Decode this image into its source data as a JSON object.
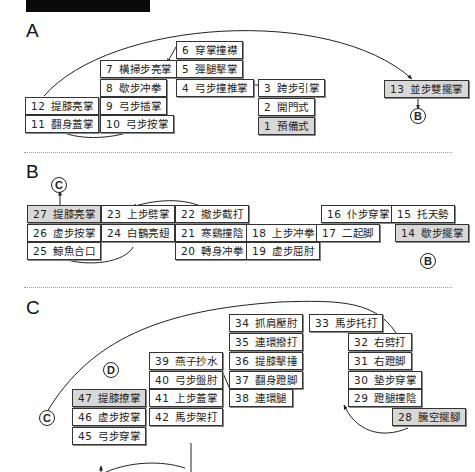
{
  "sections": {
    "A": {
      "label": "A",
      "steps": {
        "s1": {
          "num": "1",
          "name": "預備式"
        },
        "s2": {
          "num": "2",
          "name": "開門式"
        },
        "s3": {
          "num": "3",
          "name": "跨步引掌"
        },
        "s4": {
          "num": "4",
          "name": "弓步撞推掌"
        },
        "s5": {
          "num": "5",
          "name": "彈腿擊掌"
        },
        "s6": {
          "num": "6",
          "name": "穿掌撞襟"
        },
        "s7": {
          "num": "7",
          "name": "橫掃步亮掌"
        },
        "s8": {
          "num": "8",
          "name": "歇步冲拳"
        },
        "s9": {
          "num": "9",
          "name": "弓步插掌"
        },
        "s10": {
          "num": "10",
          "name": "弓步按掌"
        },
        "s11": {
          "num": "11",
          "name": "翻身蓋掌"
        },
        "s12": {
          "num": "12",
          "name": "提膝亮掌"
        },
        "s13": {
          "num": "13",
          "name": "並步雙擺掌"
        }
      },
      "connector_out": "B"
    },
    "B": {
      "label": "B",
      "connector_in": "B",
      "steps": {
        "s14": {
          "num": "14",
          "name": "歇步擺掌"
        },
        "s15": {
          "num": "15",
          "name": "托天勢"
        },
        "s16": {
          "num": "16",
          "name": "仆步穿掌"
        },
        "s17": {
          "num": "17",
          "name": "二起脚"
        },
        "s18": {
          "num": "18",
          "name": "上步冲拳"
        },
        "s19": {
          "num": "19",
          "name": "虚步屈肘"
        },
        "s20": {
          "num": "20",
          "name": "轉身冲拳"
        },
        "s21": {
          "num": "21",
          "name": "寒鷄撞陰"
        },
        "s22": {
          "num": "22",
          "name": "撤步截打"
        },
        "s23": {
          "num": "23",
          "name": "上步劈掌"
        },
        "s24": {
          "num": "24",
          "name": "白鶴亮翅"
        },
        "s25": {
          "num": "25",
          "name": "鯨魚合口"
        },
        "s26": {
          "num": "26",
          "name": "虚步按掌"
        },
        "s27": {
          "num": "27",
          "name": "提膝亮掌"
        }
      },
      "connector_out": "C"
    },
    "C": {
      "label": "C",
      "connector_in": "C",
      "steps": {
        "s28": {
          "num": "28",
          "name": "騰空擺腳"
        },
        "s29": {
          "num": "29",
          "name": "蹬腿撞陰"
        },
        "s30": {
          "num": "30",
          "name": "墊步穿掌"
        },
        "s31": {
          "num": "31",
          "name": "右蹬脚"
        },
        "s32": {
          "num": "32",
          "name": "右劈打"
        },
        "s33": {
          "num": "33",
          "name": "馬步托打"
        },
        "s34": {
          "num": "34",
          "name": "抓肩壓肘"
        },
        "s35": {
          "num": "35",
          "name": "連環撥打"
        },
        "s36": {
          "num": "36",
          "name": "提膝擊捶"
        },
        "s37": {
          "num": "37",
          "name": "翻身蹬脚"
        },
        "s38": {
          "num": "38",
          "name": "連環腿"
        },
        "s39": {
          "num": "39",
          "name": "燕子抄水"
        },
        "s40": {
          "num": "40",
          "name": "弓步盤肘"
        },
        "s41": {
          "num": "41",
          "name": "上步蓋掌"
        },
        "s42": {
          "num": "42",
          "name": "馬步架打"
        },
        "s45": {
          "num": "45",
          "name": "弓步穿掌"
        },
        "s46": {
          "num": "46",
          "name": "虚步按掌"
        },
        "s47": {
          "num": "47",
          "name": "提膝撩掌"
        }
      },
      "connector_out": "D"
    }
  },
  "colors": {
    "highlight_fill": "#d8d8d8",
    "border": "#333333",
    "line": "#222222"
  }
}
